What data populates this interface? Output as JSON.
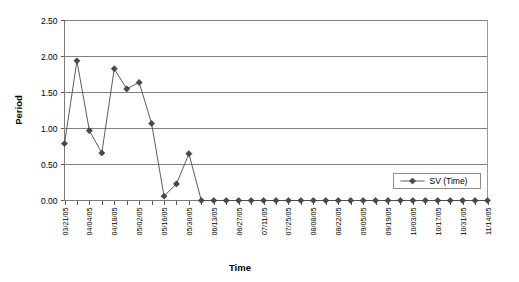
{
  "chart_data": {
    "type": "line",
    "title": "",
    "xlabel": "Time",
    "ylabel": "Period",
    "ylim": [
      0,
      2.5
    ],
    "ytick_labels": [
      "0.00",
      "0.50",
      "1.00",
      "1.50",
      "2.00",
      "2.50"
    ],
    "ytick_values": [
      0,
      0.5,
      1.0,
      1.5,
      2.0,
      2.5
    ],
    "grid": true,
    "legend_position": "inside-right",
    "legend": [
      "SV (Time)"
    ],
    "marker": "diamond",
    "x_tick_labels_every": 2,
    "x": [
      "03/21/05",
      "03/28/05",
      "04/04/05",
      "04/11/05",
      "04/18/05",
      "04/25/05",
      "05/02/05",
      "05/09/05",
      "05/16/05",
      "05/23/05",
      "05/30/05",
      "06/06/05",
      "06/13/05",
      "06/20/05",
      "06/27/05",
      "07/04/05",
      "07/11/05",
      "07/18/05",
      "07/25/05",
      "08/01/05",
      "08/08/05",
      "08/15/05",
      "08/22/05",
      "08/29/05",
      "09/05/05",
      "09/12/05",
      "09/19/05",
      "09/26/05",
      "10/03/05",
      "10/10/05",
      "10/17/05",
      "10/24/05",
      "10/31/05",
      "11/07/05",
      "11/14/05"
    ],
    "x_displayed_labels": [
      "03/21/05",
      "04/04/05",
      "04/18/05",
      "05/02/05",
      "05/16/05",
      "05/30/05",
      "06/13/05",
      "06/27/05",
      "07/11/05",
      "07/25/05",
      "08/08/05",
      "08/22/05",
      "09/05/05",
      "09/19/05",
      "10/03/05",
      "10/17/05",
      "10/31/05",
      "11/14/05"
    ],
    "series": [
      {
        "name": "SV (Time)",
        "values": [
          0.79,
          1.94,
          0.97,
          0.66,
          1.83,
          1.55,
          1.64,
          1.07,
          0.06,
          0.23,
          0.65,
          0.0,
          0.0,
          0.0,
          0.0,
          0.0,
          0.0,
          0.0,
          0.0,
          0.0,
          0.0,
          0.0,
          0.0,
          0.0,
          0.0,
          0.0,
          0.0,
          0.0,
          0.0,
          0.0,
          0.0,
          0.0,
          0.0,
          0.0,
          0.0
        ]
      }
    ],
    "colors": {
      "series": "#4a4a4a",
      "marker": "#494949",
      "gridline": "#808080",
      "plot_border": "#9a9a9a",
      "background": "#ffffff"
    }
  }
}
